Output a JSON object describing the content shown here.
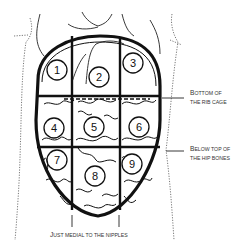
{
  "diagram": {
    "type": "abdominal-regions",
    "regions": [
      {
        "id": 1,
        "label": "1",
        "cx": 57,
        "cy": 70
      },
      {
        "id": 2,
        "label": "2",
        "cx": 99,
        "cy": 77
      },
      {
        "id": 3,
        "label": "3",
        "cx": 133,
        "cy": 63
      },
      {
        "id": 4,
        "label": "4",
        "cx": 54,
        "cy": 128
      },
      {
        "id": 5,
        "label": "5",
        "cx": 94,
        "cy": 127
      },
      {
        "id": 6,
        "label": "6",
        "cx": 139,
        "cy": 127
      },
      {
        "id": 7,
        "label": "7",
        "cx": 57,
        "cy": 160
      },
      {
        "id": 8,
        "label": "8",
        "cx": 95,
        "cy": 176
      },
      {
        "id": 9,
        "label": "9",
        "cx": 132,
        "cy": 164
      }
    ],
    "annotations": {
      "rib_cage": {
        "line1_cap": "B",
        "line1_rest": "OTTOM OF",
        "line2": "THE RIB  CAGE"
      },
      "hip_bones": {
        "line1_cap": "B",
        "line1_rest": "ELOW TOP OF",
        "line2": "THE HIP BONES"
      },
      "nipples": {
        "cap": "J",
        "rest": "UST MEDIAL TO THE NIPPLES"
      }
    },
    "colors": {
      "ink": "#111111",
      "text": "#333333",
      "background": "#ffffff"
    }
  }
}
